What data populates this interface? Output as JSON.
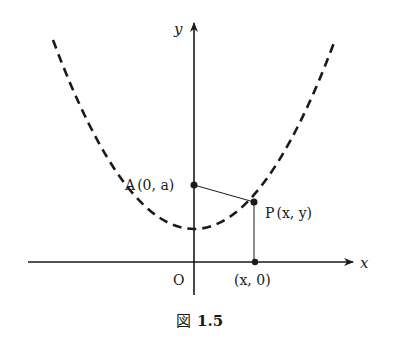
{
  "figure": {
    "caption_prefix": "図",
    "caption_number": "1.5",
    "axes": {
      "x_label": "x",
      "y_label": "y",
      "origin_label": "O"
    },
    "points": {
      "A": {
        "name": "A",
        "coords": "(0, a)"
      },
      "P": {
        "name": "P",
        "coords": "(x, y)"
      },
      "foot": {
        "coords": "(x, 0)"
      }
    },
    "curve": {
      "style": "dashed",
      "shape": "parabola"
    },
    "colors": {
      "ink": "#1a1a1a",
      "background": "#ffffff"
    }
  }
}
